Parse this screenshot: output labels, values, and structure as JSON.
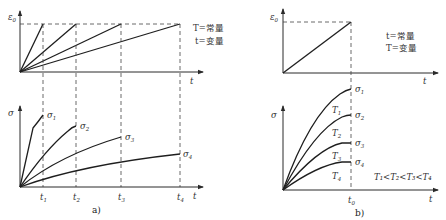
{
  "panel_a": {
    "caption": "a)",
    "top": {
      "y_label": "ε",
      "y_label_sub": "0",
      "x_label": "t",
      "note_line1": "T=常量",
      "note_line2": "t=变量"
    },
    "bottom": {
      "y_label": "σ",
      "x_label": "t",
      "ticks": [
        {
          "label": "t",
          "sub": "1"
        },
        {
          "label": "t",
          "sub": "2"
        },
        {
          "label": "t",
          "sub": "3"
        },
        {
          "label": "t",
          "sub": "4"
        }
      ],
      "curves": [
        {
          "label": "σ",
          "sub": "1"
        },
        {
          "label": "σ",
          "sub": "2"
        },
        {
          "label": "σ",
          "sub": "3"
        },
        {
          "label": "σ",
          "sub": "4"
        }
      ]
    }
  },
  "panel_b": {
    "caption": "b)",
    "top": {
      "y_label": "ε",
      "y_label_sub": "0",
      "x_label": "t",
      "note_line1": "t=常量",
      "note_line2": "T=变量"
    },
    "bottom": {
      "y_label": "σ",
      "x_label": "t",
      "tick": {
        "label": "t",
        "sub": "0"
      },
      "curves": [
        {
          "label": "σ",
          "sub": "1"
        },
        {
          "label": "σ",
          "sub": "2"
        },
        {
          "label": "σ",
          "sub": "3"
        },
        {
          "label": "σ",
          "sub": "4"
        }
      ],
      "temps": [
        {
          "label": "T",
          "sub": "1"
        },
        {
          "label": "T",
          "sub": "2"
        },
        {
          "label": "T",
          "sub": "3"
        },
        {
          "label": "T",
          "sub": "4"
        }
      ],
      "relation": "T₁<T₂<T₃<T₄"
    }
  }
}
